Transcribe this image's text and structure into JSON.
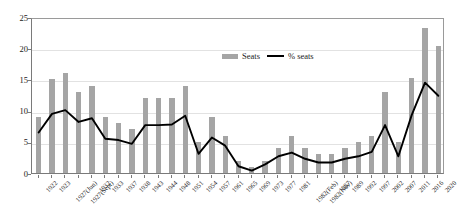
{
  "chart_data": {
    "type": "bar",
    "title": "",
    "subtitle": "",
    "xlabel": "",
    "ylabel": "",
    "ylim": [
      0,
      25
    ],
    "yticks": [
      0,
      5,
      10,
      15,
      20,
      25
    ],
    "grid": true,
    "legend_position": "top-center",
    "categories": [
      "1922",
      "1923",
      "1927(Jun)",
      "1927(Sept)",
      "1932",
      "1933",
      "1937",
      "1938",
      "1943",
      "1944",
      "1948",
      "1951",
      "1954",
      "1957",
      "1961",
      "1965",
      "1969",
      "1973",
      "1977",
      "1981",
      "1982(Feb)",
      "1982(Nov)",
      "1987",
      "1989",
      "1992",
      "1997",
      "2002",
      "2007",
      "2011",
      "2016",
      "2020"
    ],
    "series": [
      {
        "name": "Seats",
        "type": "bar",
        "color": "#a5a5a5",
        "values": [
          9,
          15,
          16,
          13,
          14,
          9,
          8,
          7,
          12,
          12,
          12,
          14,
          5,
          9,
          6,
          2,
          1,
          2,
          4,
          6,
          4,
          3,
          3,
          4,
          5,
          6,
          13,
          5,
          15.2,
          23.3,
          20.3
        ]
      },
      {
        "name": "% seats",
        "type": "line",
        "color": "#000000",
        "values": [
          6.8,
          9.8,
          10.4,
          8.5,
          9.1,
          5.8,
          5.6,
          5.0,
          8.0,
          8.0,
          8.1,
          9.5,
          3.4,
          6.0,
          4.7,
          1.4,
          0.7,
          1.7,
          3.0,
          3.6,
          2.6,
          2.0,
          2.0,
          2.6,
          3.0,
          3.7,
          8.0,
          3.0,
          9.6,
          14.8,
          12.7
        ]
      }
    ],
    "legend": [
      {
        "label": "Seats",
        "marker": "bar-swatch",
        "color": "#a5a5a5"
      },
      {
        "label": "% seats",
        "marker": "line-swatch",
        "color": "#000000"
      }
    ]
  }
}
